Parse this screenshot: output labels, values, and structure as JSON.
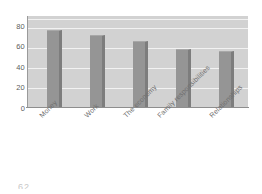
{
  "chart_data": {
    "type": "bar",
    "title": "",
    "subtitle": "",
    "xlabel": "",
    "ylabel": "",
    "categories": [
      "Money",
      "Work",
      "The economy",
      "Family responsibilities",
      "Relationships"
    ],
    "values": [
      76,
      71,
      66,
      58,
      56
    ],
    "series": [
      {
        "name": "",
        "values": [
          76,
          71,
          66,
          58,
          56
        ]
      }
    ],
    "ylim": [
      0,
      90
    ],
    "yticks": [
      0,
      20,
      40,
      60,
      80
    ],
    "ytick_labels": [
      "0",
      "20",
      "40",
      "60",
      "80"
    ],
    "grid": "horizontal",
    "legend": "none",
    "orientation": "vertical",
    "xtick_rotation": -45,
    "annotations": []
  },
  "style": {
    "plot_background": "#d2d2d2",
    "page_background": "#ffffff",
    "gridline_color": "#f2f2f2",
    "bar_color": "#959595",
    "bar_shadow_color": "#7d7d7d",
    "axis_color": "#8e8e8e",
    "tick_text_color": "#5d5d5d",
    "category_text_color": "#6f6f6f"
  },
  "artifact": {
    "text": "62"
  }
}
